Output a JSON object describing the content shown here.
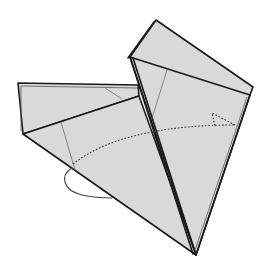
{
  "diagram": {
    "kind": "origami-fold-instruction",
    "description": "Grey paper model with left flap and right triangular flap; dotted arrow indicates swinging the left flap over to the right, with a loop arrow at the lower left",
    "colors": {
      "paper": "#d9d9d9",
      "outline": "#1a1a1a",
      "crease": "#6e6e6e",
      "arrow": "#333333",
      "background": "#ffffff"
    },
    "elements": [
      {
        "id": "left-flap",
        "label": "left flap"
      },
      {
        "id": "right-flap",
        "label": "right flap"
      },
      {
        "id": "crease-lines",
        "label": "crease lines"
      },
      {
        "id": "fold-arrow",
        "label": "dotted fold arrow (swing left to right)"
      },
      {
        "id": "loop-arrow",
        "label": "loop arrow (turn behind)"
      }
    ]
  }
}
